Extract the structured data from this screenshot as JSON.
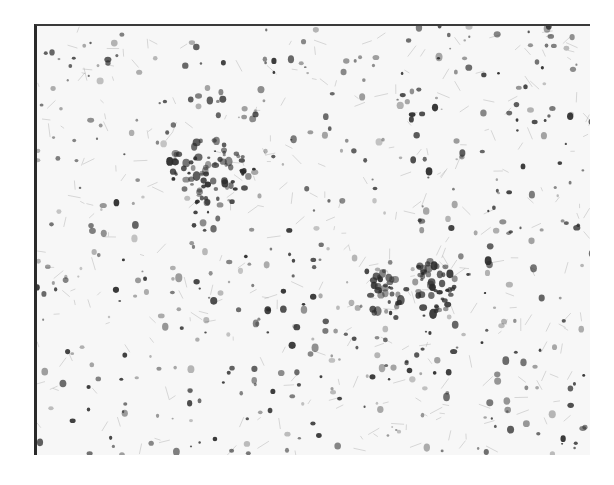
{
  "image": {
    "kind": "grayscale histology micrograph",
    "background": "#f7f7f7",
    "frame_color": "#2a2a2a",
    "cell_color": "#2b2b2b",
    "clusters": [
      {
        "cx": 170,
        "cy": 145,
        "rx": 42,
        "ry": 32,
        "count": 70
      },
      {
        "cx": 348,
        "cy": 270,
        "rx": 16,
        "ry": 26,
        "count": 30
      },
      {
        "cx": 398,
        "cy": 258,
        "rx": 20,
        "ry": 30,
        "count": 45
      }
    ],
    "scatter_count": 520,
    "seed": 7
  }
}
